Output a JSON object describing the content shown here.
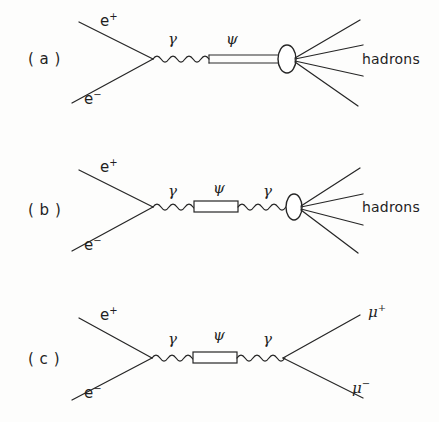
{
  "figure": {
    "background_color": "#fdfdfc",
    "ink_color": "#262626",
    "width": 439,
    "height": 422
  },
  "diagrams": [
    {
      "id": "a",
      "panel_label": "( a )",
      "panel_label_x": 28,
      "panel_label_y": 52,
      "incoming": [
        {
          "name": "positron",
          "label": "e",
          "charge": "+",
          "label_x": 100,
          "label_y": 14
        },
        {
          "name": "electron",
          "label": "e",
          "charge": "−",
          "label_x": 84,
          "label_y": 92
        }
      ],
      "propagators": [
        {
          "name": "photon",
          "style": "wavy",
          "label": "γ",
          "label_x": 168,
          "label_y": 32
        },
        {
          "name": "psi",
          "style": "double-line",
          "label": "ψ",
          "label_x": 226,
          "label_y": 32
        }
      ],
      "blob": {
        "name": "hadronization-blob",
        "cx": 287,
        "cy": 59,
        "rx": 9,
        "ry": 14
      },
      "outgoing": {
        "name": "hadrons",
        "label": "hadrons",
        "label_x": 362,
        "label_y": 52,
        "line_count": 4
      }
    },
    {
      "id": "b",
      "panel_label": "( b )",
      "panel_label_x": 28,
      "panel_label_y": 203,
      "incoming": [
        {
          "name": "positron",
          "label": "e",
          "charge": "+",
          "label_x": 100,
          "label_y": 160
        },
        {
          "name": "electron",
          "label": "e",
          "charge": "−",
          "label_x": 84,
          "label_y": 238
        }
      ],
      "propagators": [
        {
          "name": "photon-left",
          "style": "wavy",
          "label": "γ",
          "label_x": 168,
          "label_y": 184
        },
        {
          "name": "psi",
          "style": "rectangle",
          "label": "ψ",
          "label_x": 213,
          "label_y": 181
        },
        {
          "name": "photon-right",
          "style": "wavy",
          "label": "γ",
          "label_x": 263,
          "label_y": 184
        }
      ],
      "blob": {
        "name": "hadronization-blob",
        "cx": 294,
        "cy": 207,
        "rx": 8,
        "ry": 13
      },
      "outgoing": {
        "name": "hadrons",
        "label": "hadrons",
        "label_x": 362,
        "label_y": 200,
        "line_count": 4
      }
    },
    {
      "id": "c",
      "panel_label": "( c )",
      "panel_label_x": 28,
      "panel_label_y": 352,
      "incoming": [
        {
          "name": "positron",
          "label": "e",
          "charge": "+",
          "label_x": 100,
          "label_y": 308
        },
        {
          "name": "electron",
          "label": "e",
          "charge": "−",
          "label_x": 84,
          "label_y": 386
        }
      ],
      "propagators": [
        {
          "name": "photon-left",
          "style": "wavy",
          "label": "γ",
          "label_x": 168,
          "label_y": 332
        },
        {
          "name": "psi",
          "style": "rectangle",
          "label": "ψ",
          "label_x": 213,
          "label_y": 328
        },
        {
          "name": "photon-right",
          "style": "wavy",
          "label": "γ",
          "label_x": 263,
          "label_y": 332
        }
      ],
      "outgoing_particles": [
        {
          "name": "antimuon",
          "label": "μ",
          "charge": "+",
          "label_x": 368,
          "label_y": 305
        },
        {
          "name": "muon",
          "label": "μ",
          "charge": "−",
          "label_x": 352,
          "label_y": 381
        }
      ]
    }
  ]
}
